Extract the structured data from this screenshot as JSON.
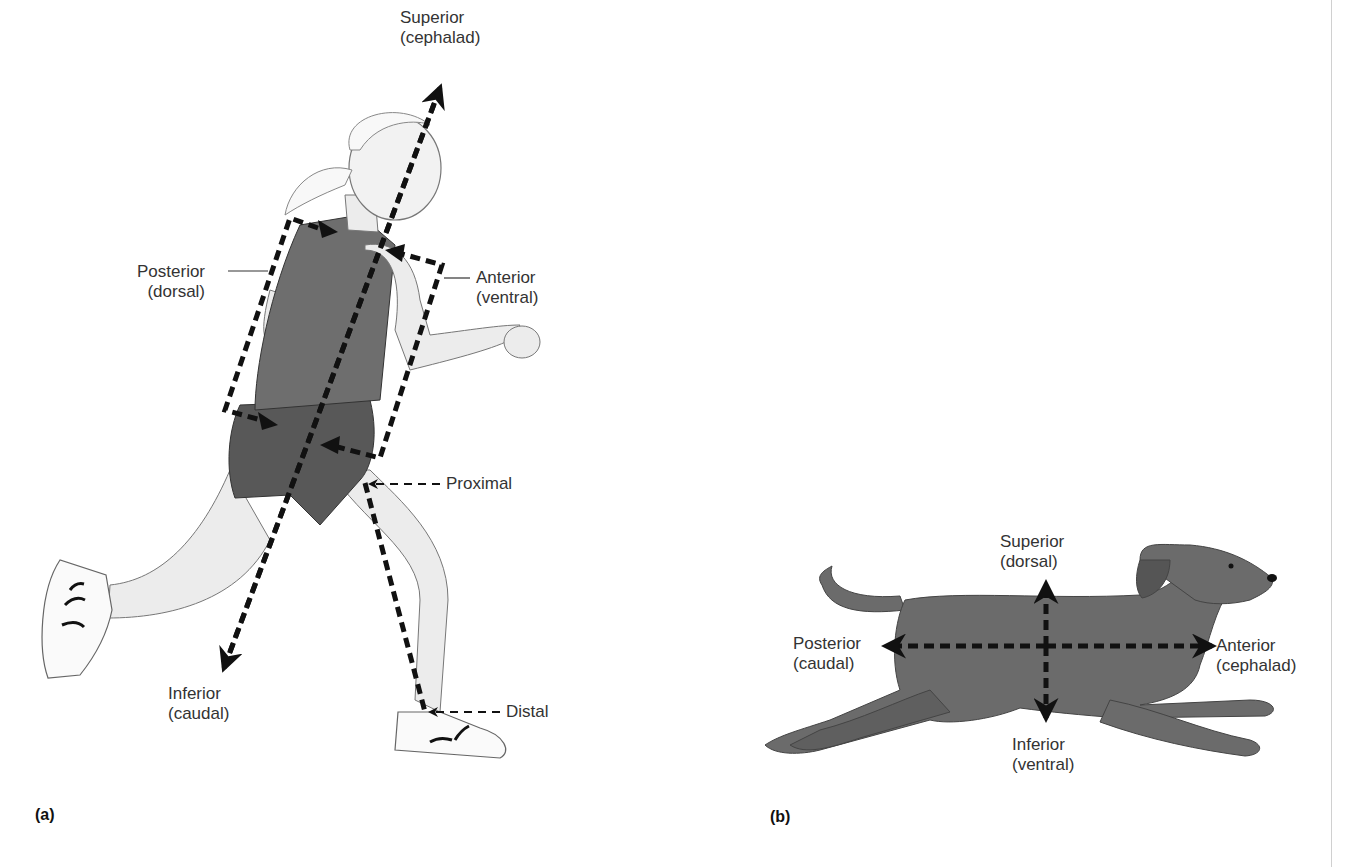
{
  "figure": {
    "panels": [
      {
        "id": "a",
        "tag": "(a)",
        "subject": "human-runner",
        "labels": {
          "superior": {
            "term": "Superior",
            "synonym": "(cephalad)"
          },
          "posterior": {
            "term": "Posterior",
            "synonym": "(dorsal)"
          },
          "anterior": {
            "term": "Anterior",
            "synonym": "(ventral)"
          },
          "proximal": {
            "term": "Proximal"
          },
          "inferior": {
            "term": "Inferior",
            "synonym": "(caudal)"
          },
          "distal": {
            "term": "Distal"
          }
        }
      },
      {
        "id": "b",
        "tag": "(b)",
        "subject": "running-dog",
        "labels": {
          "superior": {
            "term": "Superior",
            "synonym": "(dorsal)"
          },
          "posterior": {
            "term": "Posterior",
            "synonym": "(caudal)"
          },
          "anterior": {
            "term": "Anterior",
            "synonym": "(cephalad)"
          },
          "inferior": {
            "term": "Inferior",
            "synonym": "(ventral)"
          }
        }
      }
    ],
    "colors": {
      "arrow": "#111111",
      "skin": "#ececec",
      "shirt": "#6e6e6e",
      "shorts": "#585858",
      "dog": "#6b6b6b",
      "outline": "#555555"
    }
  }
}
